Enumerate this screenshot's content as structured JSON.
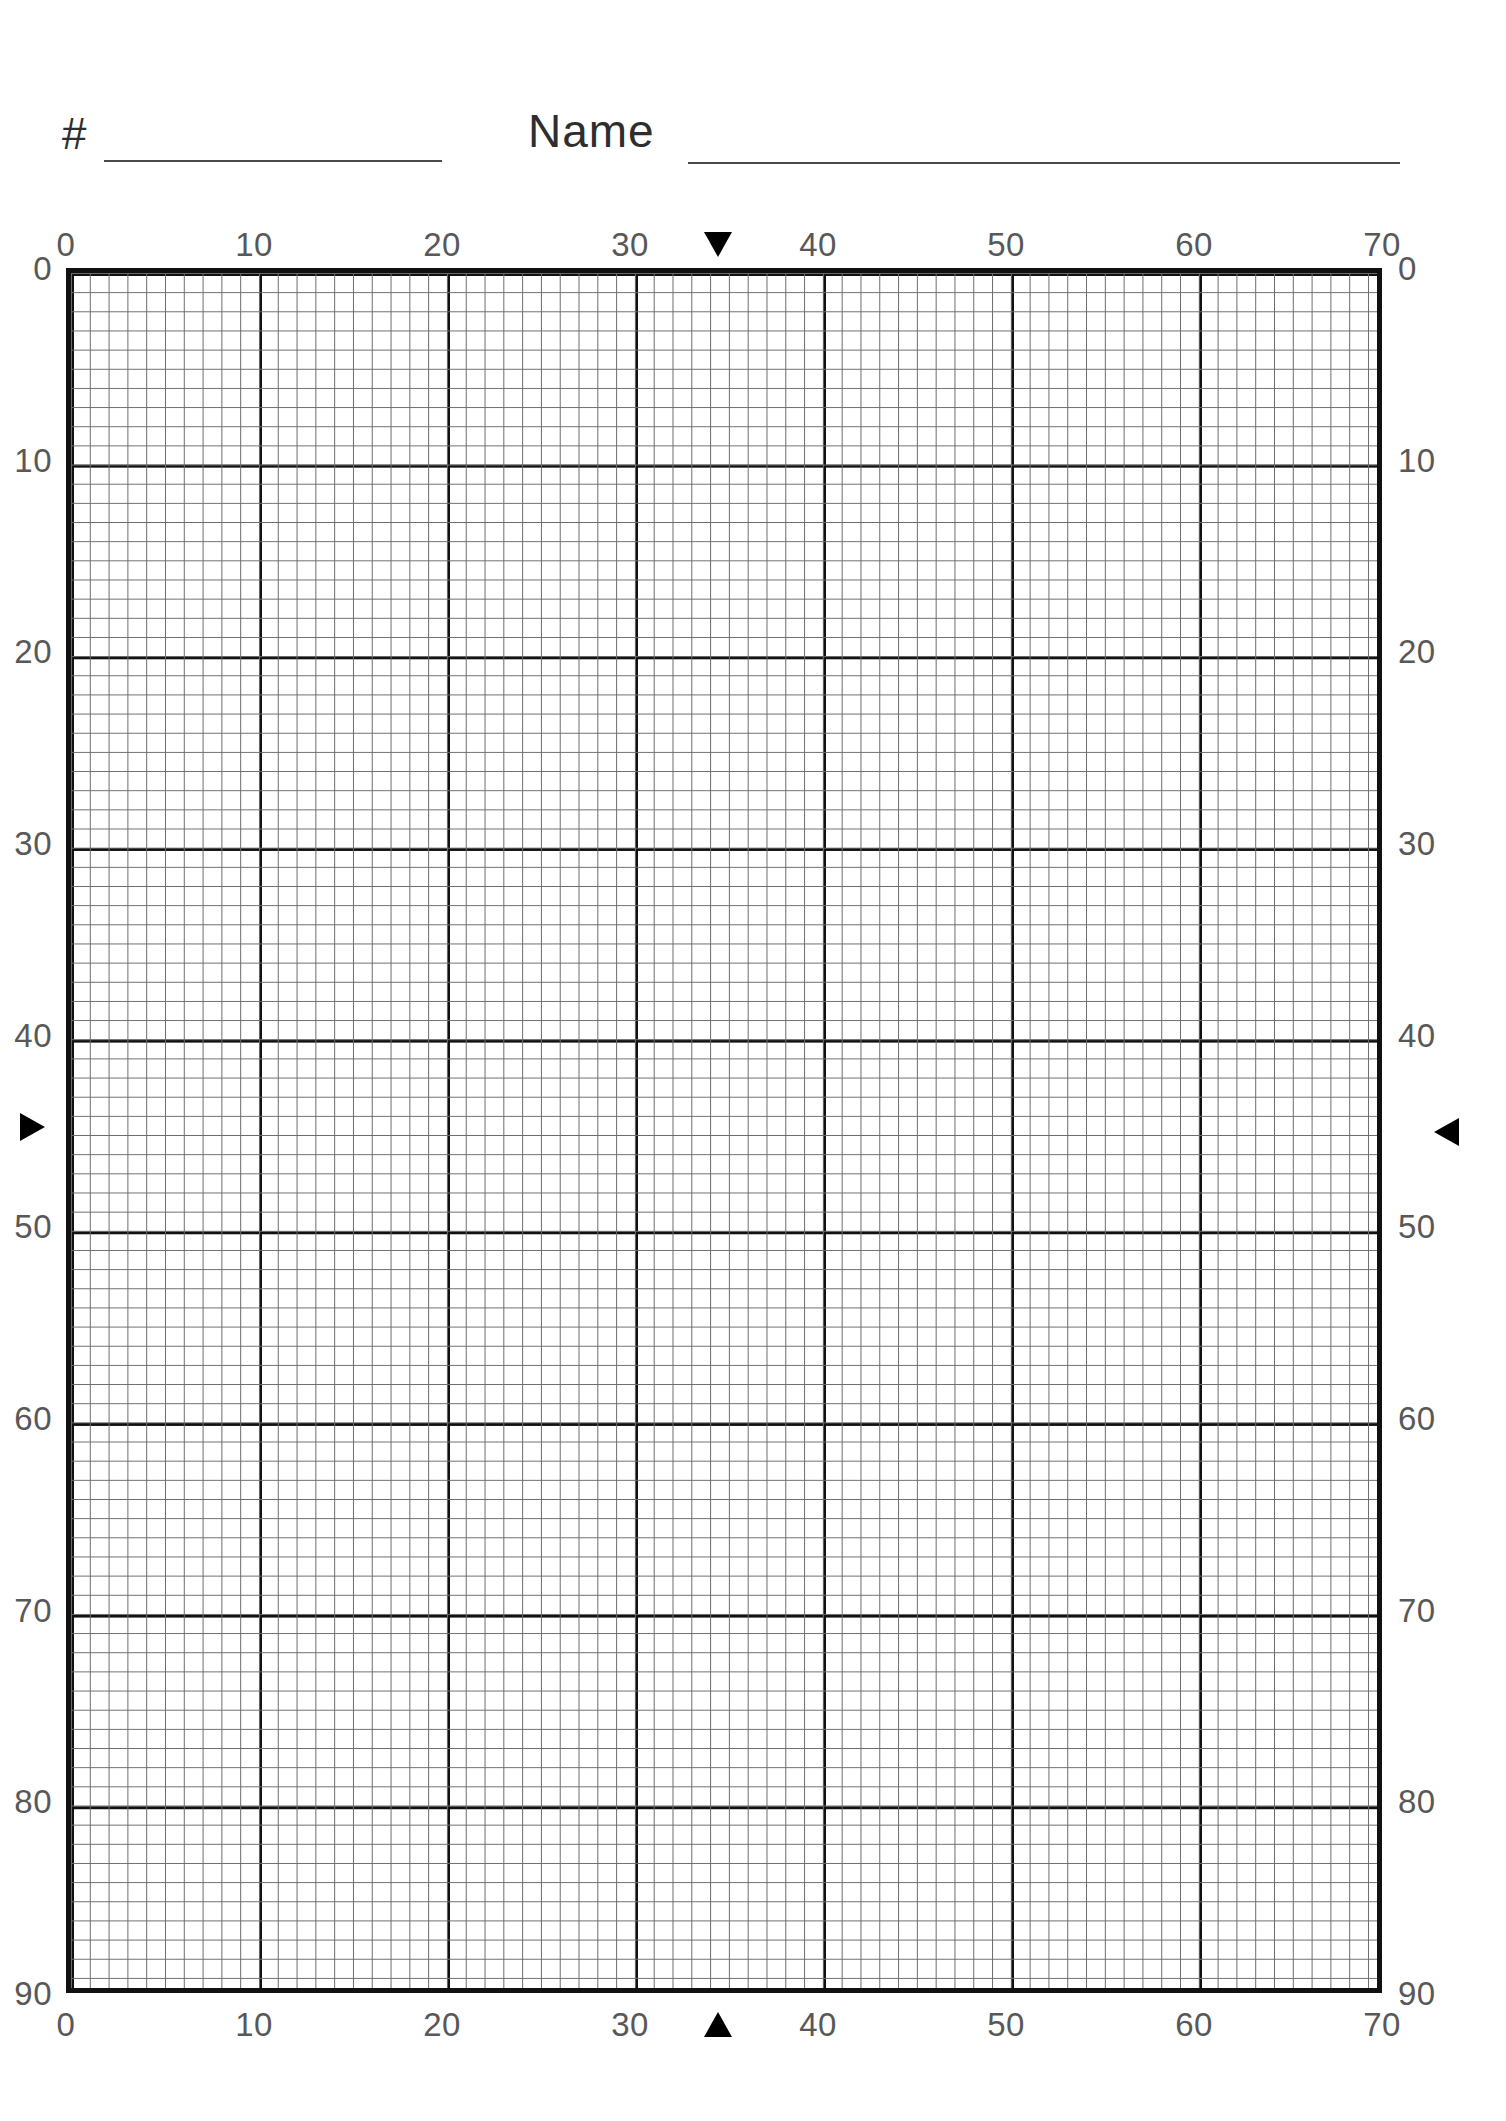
{
  "page": {
    "background_color": "#ffffff",
    "ink_color": "#111111"
  },
  "header": {
    "number_label": "#",
    "name_label": "Name",
    "number_value": "",
    "name_value": "",
    "number_placeholder": "",
    "name_placeholder": ""
  },
  "chart_data": {
    "type": "grid",
    "title": "",
    "xlabel": "",
    "ylabel": "",
    "xlim": [
      0,
      70
    ],
    "ylim": [
      0,
      90
    ],
    "y_direction": "top-to-bottom",
    "grid": true,
    "major_step": 10,
    "minor_divisions_per_major": 10,
    "major_line_color": "#111111",
    "minor_line_color": "#6b6b6b",
    "border_color": "#111111",
    "series": [],
    "values": [],
    "categories": [],
    "axes": {
      "top": {
        "ticks": [
          0,
          10,
          20,
          30,
          40,
          50,
          60,
          70
        ],
        "labels": [
          "0",
          "10",
          "20",
          "30",
          "40",
          "50",
          "60",
          "70"
        ]
      },
      "bottom": {
        "ticks": [
          0,
          10,
          20,
          30,
          40,
          50,
          60,
          70
        ],
        "labels": [
          "0",
          "10",
          "20",
          "30",
          "40",
          "50",
          "60",
          "70"
        ]
      },
      "left": {
        "ticks": [
          0,
          10,
          20,
          30,
          40,
          50,
          60,
          70,
          80,
          90
        ],
        "labels": [
          "0",
          "10",
          "20",
          "30",
          "40",
          "50",
          "60",
          "70",
          "80",
          "90"
        ]
      },
      "right": {
        "ticks": [
          0,
          10,
          20,
          30,
          40,
          50,
          60,
          70,
          80,
          90
        ],
        "labels": [
          "0",
          "10",
          "20",
          "30",
          "40",
          "50",
          "60",
          "70",
          "80",
          "90"
        ]
      }
    },
    "markers": [
      {
        "name": "top-marker",
        "icon": "triangle-down-icon",
        "axis": "top",
        "value": 34.7,
        "glyph": "▼"
      },
      {
        "name": "bottom-marker",
        "icon": "triangle-up-icon",
        "axis": "bottom",
        "value": 34.7,
        "glyph": "▲"
      },
      {
        "name": "left-marker",
        "icon": "triangle-right-icon",
        "axis": "left",
        "value": 44.8,
        "glyph": "▶"
      },
      {
        "name": "right-marker",
        "icon": "triangle-left-icon",
        "axis": "right",
        "value": 45.1,
        "glyph": "◀"
      }
    ]
  }
}
